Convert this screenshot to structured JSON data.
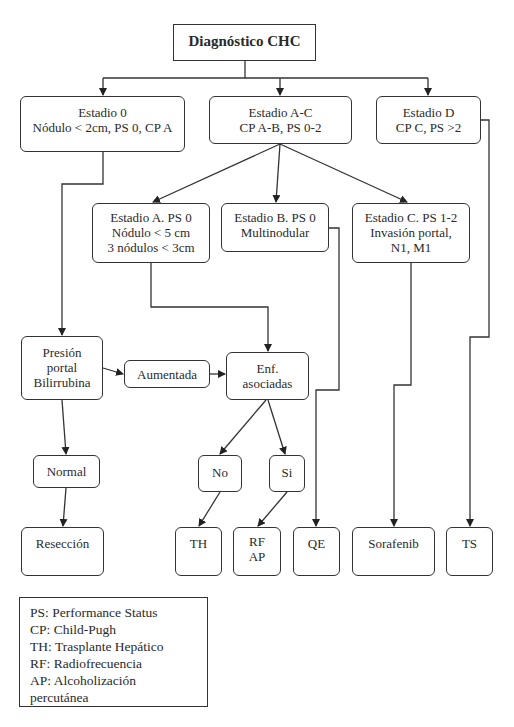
{
  "title": "Diagnóstico CHC",
  "nodes": {
    "estadio0": {
      "lines": [
        "Estadio 0",
        "Nódulo < 2cm, PS 0, CP A"
      ]
    },
    "estadioAC": {
      "lines": [
        "Estadio A-C",
        "CP A-B, PS 0-2"
      ]
    },
    "estadioD": {
      "lines": [
        "Estadio D",
        "CP C, PS >2"
      ]
    },
    "estadioA": {
      "lines": [
        "Estadio A.  PS 0",
        "Nódulo < 5 cm",
        "3 nódulos < 3cm"
      ]
    },
    "estadioB": {
      "lines": [
        "Estadio B. PS 0",
        "Multinodular"
      ]
    },
    "estadioC": {
      "lines": [
        "Estadio C. PS 1-2",
        "Invasión portal,",
        "N1, M1"
      ]
    },
    "presion": {
      "lines": [
        "Presión",
        "portal",
        "Bilirrubina"
      ]
    },
    "aumentada": {
      "lines": [
        "Aumentada"
      ]
    },
    "enf": {
      "lines": [
        "Enf.",
        "asociadas"
      ]
    },
    "normal": {
      "lines": [
        "Normal"
      ]
    },
    "no": {
      "lines": [
        "No"
      ]
    },
    "si": {
      "lines": [
        "Si"
      ]
    },
    "reseccion": {
      "lines": [
        "Resección"
      ]
    },
    "th": {
      "lines": [
        "TH"
      ]
    },
    "rfap": {
      "lines": [
        "RF",
        "AP"
      ]
    },
    "qe": {
      "lines": [
        "QE"
      ]
    },
    "sorafenib": {
      "lines": [
        "Sorafenib"
      ]
    },
    "ts": {
      "lines": [
        "TS"
      ]
    }
  },
  "legend": {
    "lines": [
      "PS: Performance Status",
      "CP: Child-Pugh",
      "TH: Trasplante Hepático",
      "RF: Radiofrecuencia",
      "AP: Alcoholización",
      "percutánea"
    ]
  },
  "colors": {
    "stroke": "#333333",
    "text": "#2a2a2a",
    "background": "#ffffff"
  }
}
